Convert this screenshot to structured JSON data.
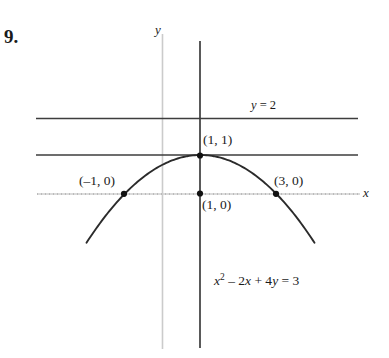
{
  "problem": {
    "number": "9."
  },
  "axes": {
    "y_label": "y",
    "x_label": "x",
    "x_axis_color": "#c9c9c9",
    "y_axis_faint_color": "#c9c9c9",
    "y_axis_dark_color": "#3a3a3a"
  },
  "lines": [
    {
      "name": "horizontal-line-y-equals-2",
      "label": "y = 2",
      "label_text_italic_part": "y",
      "label_rest": " = 2",
      "value": 2,
      "color": "#3a3a3a"
    },
    {
      "name": "horizontal-line-y-equals-1",
      "label": "",
      "value": 1,
      "color": "#3a3a3a"
    }
  ],
  "points": [
    {
      "name": "vertex",
      "label": "(1, 1)",
      "x": 1,
      "y": 1
    },
    {
      "name": "x-intercept-left",
      "label": "(–1, 0)",
      "x": -1,
      "y": 0
    },
    {
      "name": "x-intercept-right",
      "label": "(3, 0)",
      "x": 3,
      "y": 0
    },
    {
      "name": "axis-foot",
      "label": "(1, 0)",
      "x": 1,
      "y": 0
    }
  ],
  "equation": {
    "full": "x² – 2x + 4y = 3",
    "lhs_x": "x",
    "exponent": "2",
    "mid": " – 2",
    "var_x": "x",
    "plus": " + 4",
    "var_y": "y",
    "rhs": " = 3"
  },
  "chart_data": {
    "type": "line",
    "title": "",
    "xlabel": "x",
    "ylabel": "y",
    "grid": false,
    "legend": "none",
    "xlim": [
      -3.0,
      5.2
    ],
    "ylim": [
      -3.0,
      3.3
    ],
    "series": [
      {
        "name": "parabola x^2 - 2x + 4y = 3",
        "equation": "y = 1 - (x - 1)^2 / 4",
        "x": [
          -3.0,
          -2.5,
          -2.0,
          -1.5,
          -1.0,
          -0.5,
          0.0,
          0.5,
          1.0,
          1.5,
          2.0,
          2.5,
          3.0,
          3.5,
          4.0,
          4.5,
          5.0
        ],
        "values": [
          -3.0,
          -2.0625,
          -1.25,
          -0.5625,
          0.0,
          0.4375,
          0.75,
          0.9375,
          1.0,
          0.9375,
          0.75,
          0.4375,
          0.0,
          -0.5625,
          -1.25,
          -2.0625,
          -3.0
        ]
      },
      {
        "name": "horizontal line y = 2",
        "x": [
          -3.25,
          5.15
        ],
        "values": [
          2,
          2
        ]
      },
      {
        "name": "horizontal line y = 1",
        "x": [
          -3.25,
          5.15
        ],
        "values": [
          1,
          1
        ]
      }
    ],
    "annotations": [
      {
        "text": "y = 2",
        "x": 3.35,
        "y": 2.35
      },
      {
        "text": "(1, 1)",
        "x": 1.15,
        "y": 1.45
      },
      {
        "text": "(–1, 0)",
        "x": -2.05,
        "y": 0.45
      },
      {
        "text": "(3, 0)",
        "x": 3.0,
        "y": 0.45
      },
      {
        "text": "(1, 0)",
        "x": 1.1,
        "y": -0.25
      },
      {
        "text": "x² – 2x + 4y = 3",
        "x": 1.4,
        "y": -2.15
      }
    ]
  }
}
